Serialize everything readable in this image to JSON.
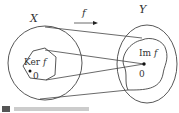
{
  "diagram": {
    "domain_label": "X",
    "codomain_label": "Y",
    "map_label": "f",
    "kernel_label": "Ker",
    "kernel_fn": "f",
    "image_label": "Im",
    "image_fn": "f",
    "zero_left": "0",
    "zero_right": "0"
  },
  "colors": {
    "stroke": "#444444",
    "text": "#333333"
  }
}
